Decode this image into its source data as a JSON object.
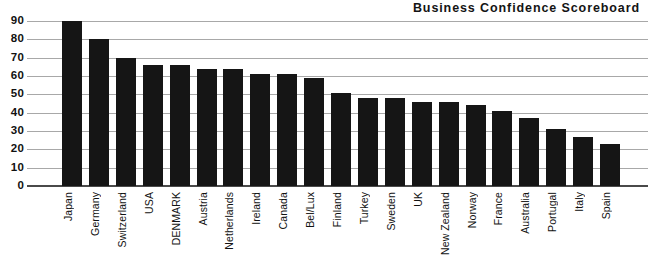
{
  "chart_data": {
    "type": "bar",
    "title": "Business Confidence Scoreboard",
    "xlabel": "",
    "ylabel": "",
    "ylim": [
      0,
      90
    ],
    "yticks": [
      0,
      10,
      20,
      30,
      40,
      50,
      60,
      70,
      80,
      90
    ],
    "grid": true,
    "legend": false,
    "orientation": "vertical",
    "bar_color": "#151515",
    "categories": [
      "Japan",
      "Germany",
      "Switzerland",
      "USA",
      "DENMARK",
      "Austria",
      "Netherlands",
      "Ireland",
      "Canada",
      "Bel/Lux",
      "Finland",
      "Turkey",
      "Sweden",
      "UK",
      "New Zealand",
      "Norway",
      "France",
      "Australia",
      "Portugal",
      "Italy",
      "Spain"
    ],
    "values": [
      90,
      80,
      70,
      66,
      66,
      64,
      64,
      61,
      61,
      59,
      51,
      48,
      48,
      46,
      46,
      44,
      41,
      37,
      31,
      27,
      23
    ]
  },
  "axis": {
    "tick_labels": [
      "90",
      "80",
      "70",
      "60",
      "50",
      "40",
      "30",
      "20",
      "10",
      "0"
    ]
  }
}
